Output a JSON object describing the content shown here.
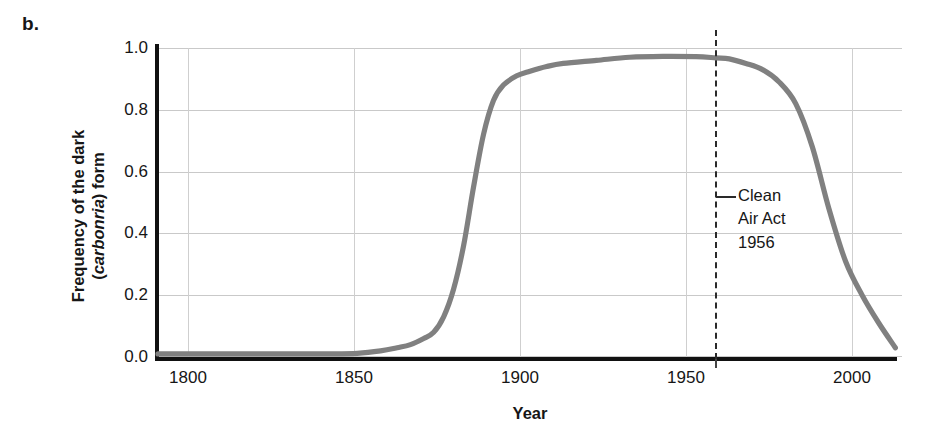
{
  "panel": {
    "label": "b."
  },
  "chart_data": {
    "type": "line",
    "title": "",
    "xlabel": "Year",
    "ylabel": "Frequency of the dark (carbonria) form",
    "ylabel_line1": "Frequency of the dark",
    "ylabel_line2_pre": "(",
    "ylabel_line2_italic": "carbonria",
    "ylabel_line2_post": ") form",
    "xlim": [
      1788,
      2012
    ],
    "ylim": [
      0.0,
      1.0
    ],
    "grid": true,
    "legend": "none",
    "line_color": "#808080",
    "xticks": [
      1800,
      1850,
      1900,
      1950,
      2000
    ],
    "xtick_labels": [
      "1800",
      "1850",
      "1900",
      "1950",
      "2000"
    ],
    "yticks": [
      0.0,
      0.2,
      0.4,
      0.6,
      0.8,
      1.0
    ],
    "ytick_labels": [
      "0.0",
      "0.2",
      "0.4",
      "0.6",
      "0.8",
      "1.0"
    ],
    "series": [
      {
        "name": "Frequency of carbonaria form",
        "x": [
          1788,
          1800,
          1810,
          1820,
          1830,
          1840,
          1848,
          1855,
          1860,
          1864,
          1868,
          1871,
          1874,
          1877,
          1880,
          1883,
          1886,
          1889,
          1892,
          1896,
          1900,
          1905,
          1910,
          1920,
          1930,
          1940,
          1950,
          1956,
          1960,
          1965,
          1970,
          1975,
          1980,
          1985,
          1990,
          1995,
          2000,
          2005,
          2010
        ],
        "y": [
          0.01,
          0.01,
          0.01,
          0.01,
          0.01,
          0.01,
          0.012,
          0.02,
          0.03,
          0.04,
          0.06,
          0.08,
          0.13,
          0.22,
          0.36,
          0.55,
          0.72,
          0.83,
          0.88,
          0.91,
          0.925,
          0.94,
          0.95,
          0.96,
          0.97,
          0.973,
          0.972,
          0.968,
          0.965,
          0.95,
          0.93,
          0.89,
          0.82,
          0.68,
          0.48,
          0.31,
          0.2,
          0.11,
          0.03
        ]
      }
    ],
    "annotations": [
      {
        "name": "clean-air-act-marker",
        "x": 1956,
        "style": "dashed-vertical-line",
        "label_lines": [
          "Clean",
          "Air Act",
          "1956"
        ]
      }
    ]
  }
}
